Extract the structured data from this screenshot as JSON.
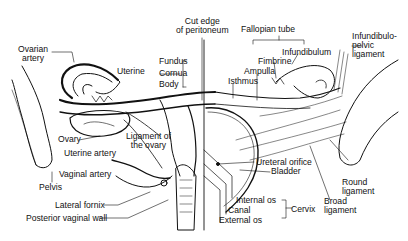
{
  "diagram": {
    "type": "anatomical illustration",
    "labels": {
      "ovarian_artery": [
        "Ovarian",
        "artery"
      ],
      "cut_edge": [
        "Cut edge",
        "of peritoneum"
      ],
      "fallopian_tube": "Fallopian tube",
      "infundibulopelvic": [
        "Infundibulo-",
        "pelvic",
        "ligament"
      ],
      "uterine": "Uterine",
      "fundus": "Fundus",
      "cornua": "Cornua",
      "body": "Body",
      "infundibulum": "Infundibulum",
      "fimbrine": "Fimbrine",
      "ampulla": "Ampulla",
      "isthmus": "Isthmus",
      "ovary": "Ovary",
      "ligament_of_ovary": [
        "Ligament of",
        "the ovary"
      ],
      "uterine_artery": "Uterine artery",
      "vaginal_artery": "Vaginal artery",
      "pelvis": "Pelvis",
      "lateral_fornix": "Lateral fornix",
      "posterior_vaginal_wall": "Posterior vaginal wall",
      "ureteral_orifice": "Ureteral orifice",
      "bladder": "Bladder",
      "round_ligament": [
        "Round",
        "ligament"
      ],
      "broad_ligament": [
        "Broad",
        "ligament"
      ],
      "internal_os": "Internal os",
      "canal": "Canal",
      "external_os": "External os",
      "cervix": "Cervix"
    },
    "colors": {
      "ink": "#111111",
      "background": "#ffffff"
    }
  }
}
